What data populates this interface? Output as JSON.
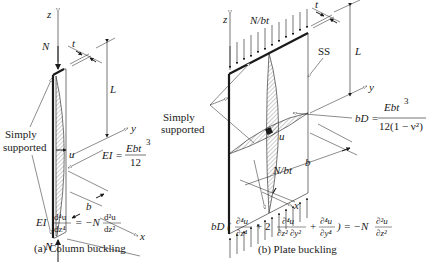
{
  "column": {
    "axis_z": "z",
    "axis_y": "y",
    "axis_x": "x",
    "load_top": "N",
    "load_bottom": "N",
    "thickness": "t",
    "length": "L",
    "width": "b",
    "deflection": "u",
    "support_label_1": "Simply",
    "support_label_2": "supported",
    "stiffness_lhs": "EI =",
    "stiffness_num": "Ebt",
    "stiffness_num_exp": "3",
    "stiffness_den": "12",
    "equation": {
      "lhs_coef": "EI",
      "lhs_num": "d⁴u",
      "lhs_den": "dz⁴",
      "equals": "= −N",
      "rhs_num": "d²u",
      "rhs_den": "dz²"
    },
    "caption": "(a) Column buckling"
  },
  "plate": {
    "axis_z": "z",
    "axis_y": "y",
    "axis_x": "x",
    "load_top": "N/bt",
    "load_bottom": "N/bt",
    "thickness": "t",
    "length": "L",
    "width": "b",
    "deflection": "u",
    "ss_label": "SS",
    "support_label_1": "Simply",
    "support_label_2": "supported",
    "stiffness_lhs": "bD =",
    "stiffness_num": "Ebt",
    "stiffness_num_exp": "3",
    "stiffness_den": "12(1 − ν²)",
    "equation": {
      "prefix": "bD (",
      "t1_num": "∂⁴u",
      "t1_den": "∂z⁴",
      "plus2": "+ 2",
      "t2_num": "∂⁴u",
      "t2_den": "∂z² ∂y²",
      "plus": "+",
      "t3_num": "∂⁴u",
      "t3_den": "∂y⁴",
      "suffix": ") = −N",
      "rhs_num": "∂²u",
      "rhs_den": "∂z²"
    },
    "caption": "(b) Plate buckling"
  }
}
